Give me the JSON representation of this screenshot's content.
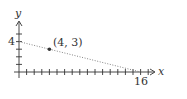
{
  "chart_data": {
    "type": "line",
    "title": "",
    "xlabel": "x",
    "ylabel": "y",
    "xlim": [
      0,
      18
    ],
    "ylim": [
      0,
      5.5
    ],
    "x_ticks": "integer ticks from 1 to 17",
    "y_ticks": "integer ticks from 1 to 5",
    "labeled_ticks": {
      "x": [
        "16"
      ],
      "y": [
        "4"
      ]
    },
    "grid": false,
    "series": [
      {
        "name": "line",
        "style": "dotted",
        "x": [
          0,
          16
        ],
        "y": [
          4,
          0
        ]
      }
    ],
    "points": [
      {
        "x": 4,
        "y": 3,
        "label": "(4, 3)"
      }
    ]
  },
  "labels": {
    "x_axis": "x",
    "y_axis": "y",
    "x_tick_16": "16",
    "y_tick_4": "4",
    "point": "(4, 3)"
  },
  "colors": {
    "axis": "#333333",
    "line": "#777777",
    "point": "#333333"
  }
}
